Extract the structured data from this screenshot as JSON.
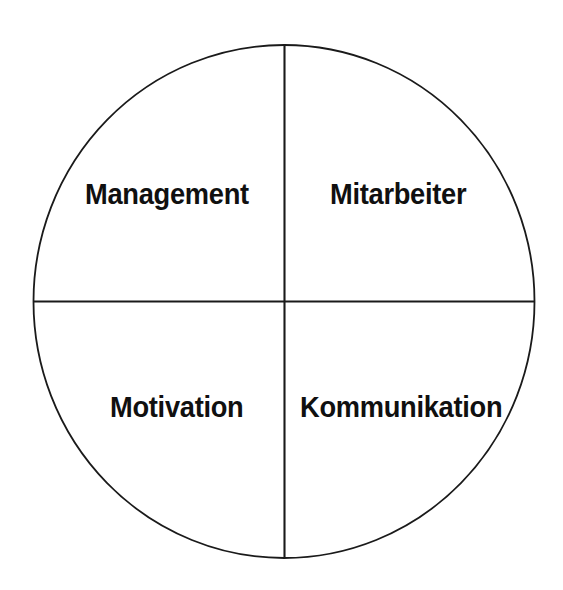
{
  "diagram": {
    "type": "quadrant-circle",
    "title": "",
    "shape": {
      "name": "circle-outline",
      "center_x": 284,
      "center_y": 301,
      "radius_x": 251,
      "radius_y": 257,
      "stroke_color": "#1a1a1a",
      "stroke_width": 1.8,
      "fill_color": "#ffffff"
    },
    "dividers": [
      {
        "name": "vertical-divider",
        "orientation": "vertical",
        "x": 284,
        "y1": 45,
        "y2": 558,
        "stroke_color": "#1a1a1a",
        "stroke_width": 2
      },
      {
        "name": "horizontal-divider",
        "orientation": "horizontal",
        "y": 301,
        "x1": 33,
        "x2": 535,
        "stroke_color": "#1a1a1a",
        "stroke_width": 2
      }
    ],
    "quadrants": [
      {
        "position": "top-left",
        "label": "Management"
      },
      {
        "position": "top-right",
        "label": "Mitarbeiter"
      },
      {
        "position": "bottom-left",
        "label": "Motivation"
      },
      {
        "position": "bottom-right",
        "label": "Kommunikation"
      }
    ],
    "colors": {
      "background": "#ffffff",
      "line": "#1a1a1a",
      "text": "#101010"
    }
  }
}
